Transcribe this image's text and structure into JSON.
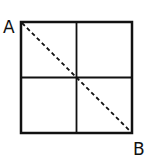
{
  "diagram": {
    "type": "grid-square",
    "square": {
      "x": 21,
      "y": 22,
      "size": 111
    },
    "grid": {
      "rows": 2,
      "cols": 2
    },
    "diagonal": {
      "from": "A",
      "to": "B",
      "style": "dashed"
    },
    "labels": {
      "a": "A",
      "b": "B"
    },
    "colors": {
      "stroke": "#111111",
      "background": "#ffffff"
    }
  }
}
